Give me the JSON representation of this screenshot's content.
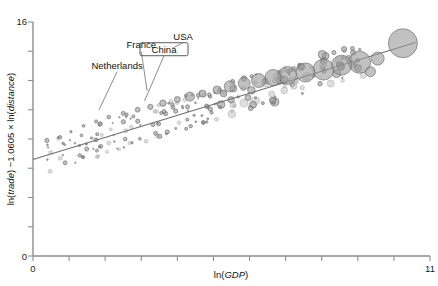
{
  "chart_data": {
    "type": "scatter",
    "title": "",
    "xlabel_parts": {
      "pre": "ln(",
      "it": "GDP",
      "post": ")"
    },
    "ylabel_parts": {
      "pre": "ln(",
      "it1": "trade",
      "mid": ") −1.0605 × ln(",
      "it2": "distance",
      "post": ")"
    },
    "xlabel": "ln(GDP)",
    "ylabel": "ln(trade) −1.0605 × ln(distance)",
    "xlim": [
      0,
      11
    ],
    "ylim": [
      0,
      16
    ],
    "xticks": [
      0,
      1,
      2,
      3,
      4,
      5,
      6,
      7,
      8,
      9,
      10,
      11
    ],
    "yticks": [
      0,
      2,
      4,
      6,
      8,
      10,
      12,
      14,
      16
    ],
    "xtick_labels_shown": [
      "0",
      "11"
    ],
    "ytick_labels_shown": [
      "0",
      "16"
    ],
    "grid": false,
    "legend": "none",
    "marker": "bubble",
    "bubble_meaning": "marker area scales with country trade volume",
    "regression_line": {
      "x0": 0,
      "y0": 6.6,
      "x1": 10.6,
      "y1": 14.6,
      "slope": 0.755,
      "intercept": 6.6
    },
    "annotations": [
      {
        "label": "Netherlands",
        "text_x": 2.33,
        "text_y": 1.28,
        "point_x": 1.83,
        "point_y": 1.0
      },
      {
        "label": "France",
        "text_x": 3.0,
        "text_y": 1.42,
        "point_x": 3.16,
        "point_y": 1.13
      },
      {
        "label": "China",
        "text_x": 3.63,
        "text_y": 1.39,
        "point_x": 3.09,
        "point_y": 1.06,
        "boxed": true
      },
      {
        "label": "USA",
        "text_x": 4.16,
        "text_y": 1.48,
        "point_x": 3.86,
        "point_y": 1.42
      }
    ],
    "points": [
      {
        "x": 10.25,
        "y": 14.55,
        "r": 14.5,
        "label": "USA"
      },
      {
        "x": 9.05,
        "y": 13.25,
        "r": 11.0,
        "label": "France"
      },
      {
        "x": 8.55,
        "y": 13.05,
        "r": 10.0
      },
      {
        "x": 8.05,
        "y": 12.75,
        "r": 10.5
      },
      {
        "x": 7.55,
        "y": 12.55,
        "r": 9.5,
        "label": "Netherlands"
      },
      {
        "x": 7.05,
        "y": 12.35,
        "r": 9.0
      },
      {
        "x": 6.65,
        "y": 12.2,
        "r": 8.0
      },
      {
        "x": 6.25,
        "y": 12.0,
        "r": 7.0
      },
      {
        "x": 5.85,
        "y": 11.8,
        "r": 6.0
      },
      {
        "x": 9.55,
        "y": 13.5,
        "r": 6.5
      },
      {
        "x": 9.35,
        "y": 12.6,
        "r": 5.0
      },
      {
        "x": 5.45,
        "y": 11.6,
        "r": 5.5
      },
      {
        "x": 5.1,
        "y": 11.35,
        "r": 4.0
      },
      {
        "x": 4.7,
        "y": 11.1,
        "r": 3.5
      },
      {
        "x": 4.35,
        "y": 10.9,
        "r": 4.5
      },
      {
        "x": 4.0,
        "y": 10.7,
        "r": 3.0
      },
      {
        "x": 3.6,
        "y": 10.45,
        "r": 3.2
      },
      {
        "x": 3.25,
        "y": 10.2,
        "r": 2.6
      },
      {
        "x": 2.9,
        "y": 10.0,
        "r": 2.4
      },
      {
        "x": 2.5,
        "y": 9.75,
        "r": 2.0
      },
      {
        "x": 2.1,
        "y": 9.5,
        "r": 1.8
      },
      {
        "x": 1.75,
        "y": 9.2,
        "r": 1.6
      },
      {
        "x": 1.4,
        "y": 8.9,
        "r": 1.4
      },
      {
        "x": 1.05,
        "y": 8.5,
        "r": 1.2
      },
      {
        "x": 0.7,
        "y": 8.1,
        "r": 1.0
      },
      {
        "x": 0.4,
        "y": 7.6,
        "r": 0.9
      }
    ]
  },
  "colors": {
    "bubble_fill": "#9b9b9b",
    "bubble_stroke": "#6a6a6a",
    "axis": "#8e8e8e",
    "line": "#6f6f6f",
    "text": "#111111",
    "background": "#ffffff"
  }
}
